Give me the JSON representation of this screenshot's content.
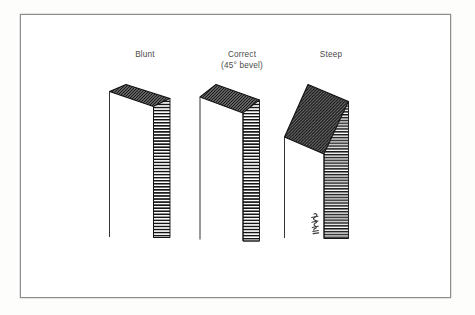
{
  "figure": {
    "title_alt": "Needle bevel angle comparison",
    "plate_border_color": "#8d8d8d",
    "background_color": "#ffffff",
    "ink_color": "#1a1a1a",
    "caption_color": "#4a4a4a",
    "bevel_fill_color": "#5a5a5a",
    "shaft_hatch_color": "#2b2b2b"
  },
  "labels": {
    "blunt": "Blunt",
    "correct_line1": "Correct",
    "correct_line2": "(45° bevel)",
    "steep": "Steep"
  },
  "specimens": [
    {
      "name": "blunt",
      "label": "Blunt",
      "bevel_description": "shallow, nearly flat bevel face",
      "bevel_angle_deg": 20
    },
    {
      "name": "correct",
      "label": "Correct",
      "sublabel": "(45° bevel)",
      "bevel_description": "medium bevel face",
      "bevel_angle_deg": 45
    },
    {
      "name": "steep",
      "label": "Steep",
      "bevel_description": "long, steeply inclined bevel face",
      "bevel_angle_deg": 70
    }
  ],
  "signature": {
    "name": "artist-signature",
    "visible": true
  }
}
